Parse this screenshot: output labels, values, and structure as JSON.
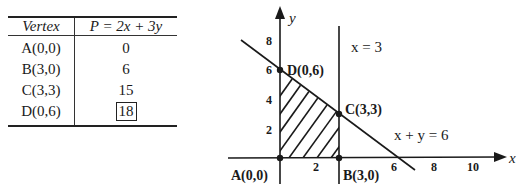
{
  "table": {
    "headers": [
      "Vertex",
      "P = 2x + 3y"
    ],
    "rows": [
      {
        "vertex": "A(0,0)",
        "value": "0",
        "boxed": false
      },
      {
        "vertex": "B(3,0)",
        "value": "6",
        "boxed": false
      },
      {
        "vertex": "C(3,3)",
        "value": "15",
        "boxed": false
      },
      {
        "vertex": "D(0,6)",
        "value": "18",
        "boxed": true
      }
    ]
  },
  "graph": {
    "x_axis_label": "x",
    "y_axis_label": "y",
    "x_ticks": [
      "2",
      "6",
      "8",
      "10"
    ],
    "y_ticks": [
      "2",
      "4",
      "6",
      "8"
    ],
    "lines": {
      "vertical": "x = 3",
      "slant": "x + y = 6"
    },
    "points": {
      "A": "A(0,0)",
      "B": "B(3,0)",
      "C": "C(3,3)",
      "D": "D(0,6)"
    },
    "feasible_region": "hatched quadrilateral A-B-C-D"
  }
}
